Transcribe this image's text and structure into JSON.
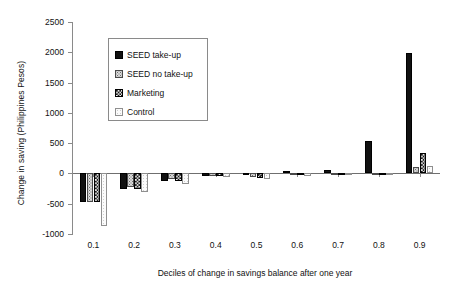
{
  "chart_data": {
    "type": "bar",
    "title": "",
    "xlabel": "Deciles of change in savings balance after one year",
    "ylabel": "Change in saving (Philippines Pesos)",
    "categories": [
      "0.1",
      "0.2",
      "0.3",
      "0.4",
      "0.5",
      "0.6",
      "0.7",
      "0.8",
      "0.9"
    ],
    "ylim": [
      -1000,
      2500
    ],
    "yticks": [
      "2500",
      "2000",
      "1500",
      "1000",
      "500",
      "0",
      "-500",
      "-1000"
    ],
    "ytick_values": [
      2500,
      2000,
      1500,
      1000,
      500,
      0,
      -500,
      -1000
    ],
    "grid": false,
    "legend_position": "upper-left-inside",
    "series": [
      {
        "name": "SEED take-up",
        "pattern": "solid-black",
        "color": "#111111",
        "values": [
          -470,
          -250,
          -120,
          -40,
          -30,
          40,
          60,
          540,
          1990
        ]
      },
      {
        "name": "SEED no take-up",
        "pattern": "light-dots",
        "color": "#d9d9d9",
        "values": [
          -470,
          -230,
          -100,
          -35,
          -60,
          -20,
          0,
          10,
          100
        ]
      },
      {
        "name": "Marketing",
        "pattern": "checker",
        "color": "#1a1a1a",
        "values": [
          -470,
          -260,
          -130,
          -45,
          -75,
          -30,
          0,
          10,
          330
        ]
      },
      {
        "name": "Control",
        "pattern": "open-light",
        "color": "#fbfbfb",
        "values": [
          -860,
          -310,
          -170,
          -55,
          -85,
          -40,
          0,
          10,
          120
        ]
      }
    ]
  },
  "legend": {
    "items": [
      {
        "label": "SEED take-up"
      },
      {
        "label": "SEED no take-up"
      },
      {
        "label": "Marketing"
      },
      {
        "label": "Control"
      }
    ]
  }
}
